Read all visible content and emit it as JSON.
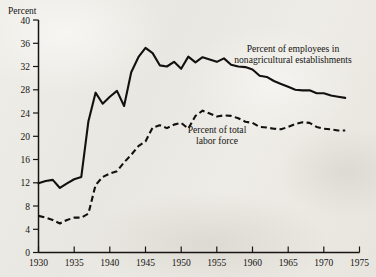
{
  "chart_data": {
    "type": "line",
    "title": "",
    "xlabel": "",
    "ylabel": "Percent",
    "ylim": [
      0,
      40
    ],
    "xlim": [
      1930,
      1975
    ],
    "grid": false,
    "legend_position": "inline-annotations",
    "yticks": [
      0,
      4,
      8,
      12,
      16,
      20,
      24,
      28,
      32,
      36,
      40
    ],
    "ytick_labels": [
      "0",
      "4",
      "8",
      "12",
      "16",
      "20",
      "24",
      "28",
      "32",
      "36",
      "40"
    ],
    "xticks": [
      1930,
      1935,
      1940,
      1945,
      1950,
      1955,
      1960,
      1965,
      1970,
      1975
    ],
    "xtick_labels": [
      "1930",
      "1935",
      "1940",
      "1945",
      "1950",
      "1955",
      "1960",
      "1965",
      "1970",
      "1975"
    ],
    "x": [
      1930,
      1931,
      1932,
      1933,
      1934,
      1935,
      1936,
      1937,
      1938,
      1939,
      1940,
      1941,
      1942,
      1943,
      1944,
      1945,
      1946,
      1947,
      1948,
      1949,
      1950,
      1951,
      1952,
      1953,
      1954,
      1955,
      1956,
      1957,
      1958,
      1959,
      1960,
      1961,
      1962,
      1963,
      1964,
      1965,
      1966,
      1967,
      1968,
      1969,
      1970,
      1971,
      1972,
      1973
    ],
    "series": [
      {
        "name": "Percent of employees in nonagricultural establishments",
        "style": "solid",
        "values": [
          11.9,
          12.3,
          12.5,
          11.1,
          11.9,
          12.6,
          13.0,
          22.6,
          27.5,
          25.6,
          26.8,
          27.8,
          25.2,
          31.0,
          33.6,
          35.2,
          34.3,
          32.2,
          32.0,
          32.8,
          31.6,
          33.7,
          32.7,
          33.6,
          33.2,
          32.8,
          33.4,
          32.3,
          32.0,
          31.9,
          31.5,
          30.4,
          30.2,
          29.5,
          29.0,
          28.5,
          28.0,
          27.9,
          27.9,
          27.4,
          27.4,
          27.0,
          26.8,
          26.6
        ]
      },
      {
        "name": "Percent of total labor force",
        "style": "dashed",
        "values": [
          6.3,
          6.0,
          5.6,
          5.0,
          5.6,
          6.0,
          6.0,
          6.7,
          11.6,
          13.0,
          13.6,
          14.0,
          15.5,
          16.8,
          18.3,
          19.1,
          21.5,
          21.9,
          21.4,
          22.0,
          22.3,
          21.3,
          23.5,
          24.4,
          23.9,
          23.4,
          23.6,
          23.5,
          23.1,
          22.5,
          22.3,
          21.6,
          21.5,
          21.3,
          21.2,
          21.6,
          22.1,
          22.4,
          22.3,
          21.6,
          21.3,
          21.2,
          21.0,
          21.0
        ]
      }
    ],
    "annotations": [
      {
        "id": "annotation-nonagricultural",
        "lines": [
          "Percent of employees in",
          "nonagricultural establishments"
        ],
        "x_px": 293,
        "y_px": 52
      },
      {
        "id": "annotation-labor-force",
        "lines": [
          "Percent of total",
          "labor force"
        ],
        "x_px": 217,
        "y_px": 133
      }
    ]
  },
  "axes": {
    "y_axis_title": "Percent"
  }
}
